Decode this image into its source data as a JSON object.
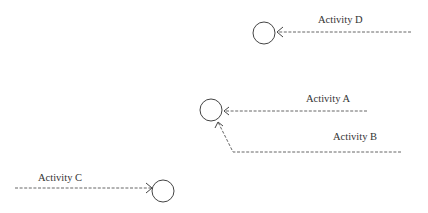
{
  "diagram": {
    "type": "activity-on-arrow network fragment",
    "colors": {
      "stroke": "#444444",
      "text": "#333333",
      "background": "#ffffff"
    },
    "nodes": [
      {
        "id": "node-top",
        "cx": 264,
        "cy": 33,
        "r": 11
      },
      {
        "id": "node-middle",
        "cx": 211,
        "cy": 110,
        "r": 11
      },
      {
        "id": "node-bottom",
        "cx": 163,
        "cy": 191,
        "r": 11
      }
    ],
    "activities": [
      {
        "label": "Activity D",
        "from": [
          411,
          32
        ],
        "to": [
          277,
          32
        ],
        "label_pos": [
          318,
          23
        ],
        "target": "node-top"
      },
      {
        "label": "Activity A",
        "from": [
          367,
          111
        ],
        "to": [
          224,
          111
        ],
        "label_pos": [
          306,
          102
        ],
        "target": "node-middle"
      },
      {
        "label": "Activity B",
        "from": [
          401,
          152
        ],
        "to": [
          233,
          152
        ],
        "bend_to": [
          218,
          122
        ],
        "label_pos": [
          333,
          140
        ],
        "target": "node-middle"
      },
      {
        "label": "Activity C",
        "from": [
          15,
          188
        ],
        "to": [
          151,
          188
        ],
        "label_pos": [
          38,
          181
        ],
        "target": "node-bottom"
      }
    ]
  }
}
